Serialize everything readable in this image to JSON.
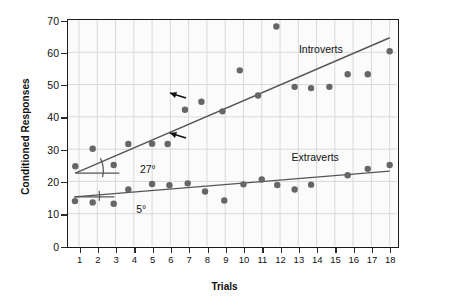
{
  "chart_data": {
    "type": "scatter",
    "title": "",
    "xlabel": "Trials",
    "ylabel": "Conditioned Responses",
    "xlim": [
      0.4,
      18.4
    ],
    "ylim": [
      0,
      70
    ],
    "xticks": [
      "1",
      "2",
      "3",
      "4",
      "5",
      "6",
      "7",
      "8",
      "9",
      "10",
      "11",
      "12",
      "13",
      "14",
      "15",
      "16",
      "17",
      "18"
    ],
    "yticks": [
      "0",
      "10",
      "20",
      "30",
      "40",
      "50",
      "60",
      "70"
    ],
    "grid": true,
    "legend_position": "inline-annotation",
    "series": [
      {
        "name": "Introverts",
        "label": "Introverts",
        "color": "#666666",
        "marker": "circle",
        "trendline": {
          "x0": 0.8,
          "y0": 22.6,
          "x1": 18.0,
          "y1": 64.5,
          "color": "#555555"
        },
        "angle_annotation": "27°",
        "points": [
          {
            "x": 0.8,
            "y": 24.7
          },
          {
            "x": 1.75,
            "y": 30.1
          },
          {
            "x": 2.9,
            "y": 25.1
          },
          {
            "x": 3.7,
            "y": 31.6
          },
          {
            "x": 5.0,
            "y": 31.7
          },
          {
            "x": 5.85,
            "y": 31.6
          },
          {
            "x": 6.8,
            "y": 42.2
          },
          {
            "x": 7.7,
            "y": 44.7
          },
          {
            "x": 8.85,
            "y": 41.7
          },
          {
            "x": 9.8,
            "y": 54.4
          },
          {
            "x": 10.8,
            "y": 46.6
          },
          {
            "x": 11.8,
            "y": 68.0
          },
          {
            "x": 12.8,
            "y": 49.3
          },
          {
            "x": 13.7,
            "y": 48.9
          },
          {
            "x": 14.7,
            "y": 49.3
          },
          {
            "x": 15.7,
            "y": 53.2
          },
          {
            "x": 16.8,
            "y": 53.2
          },
          {
            "x": 18.0,
            "y": 60.3
          }
        ]
      },
      {
        "name": "Extraverts",
        "label": "Extraverts",
        "color": "#666666",
        "marker": "circle",
        "trendline": {
          "x0": 0.75,
          "y0": 15.2,
          "x1": 18.0,
          "y1": 23.2,
          "color": "#555555"
        },
        "angle_annotation": "5°",
        "points": [
          {
            "x": 0.78,
            "y": 13.9
          },
          {
            "x": 1.75,
            "y": 13.5
          },
          {
            "x": 2.9,
            "y": 13.1
          },
          {
            "x": 3.7,
            "y": 17.5
          },
          {
            "x": 5.0,
            "y": 19.2
          },
          {
            "x": 5.95,
            "y": 18.8
          },
          {
            "x": 6.95,
            "y": 19.4
          },
          {
            "x": 7.9,
            "y": 16.9
          },
          {
            "x": 8.95,
            "y": 14.1
          },
          {
            "x": 10.0,
            "y": 19.1
          },
          {
            "x": 11.0,
            "y": 20.6
          },
          {
            "x": 11.85,
            "y": 18.9
          },
          {
            "x": 12.8,
            "y": 17.5
          },
          {
            "x": 13.7,
            "y": 19.0
          },
          {
            "x": 15.7,
            "y": 21.9
          },
          {
            "x": 16.8,
            "y": 23.9
          },
          {
            "x": 18.0,
            "y": 25.1
          }
        ]
      }
    ],
    "annotations": [
      {
        "text": "27°",
        "kind": "angle-callout",
        "target_series": "Introverts"
      },
      {
        "text": "5°",
        "kind": "angle-callout",
        "target_series": "Extraverts"
      }
    ]
  },
  "axes": {
    "x_title": "Trials",
    "y_title": "Conditioned Responses"
  },
  "labels": {
    "introverts": "Introverts",
    "extraverts": "Extraverts",
    "angle_introverts": "27°",
    "angle_extraverts": "5°"
  },
  "colors": {
    "marker": "#666666",
    "trendline": "#555555",
    "grid": "#d9d9d9",
    "axis": "#1a1a1a",
    "text": "#111111",
    "plot_bg": "#fbfbfb"
  }
}
